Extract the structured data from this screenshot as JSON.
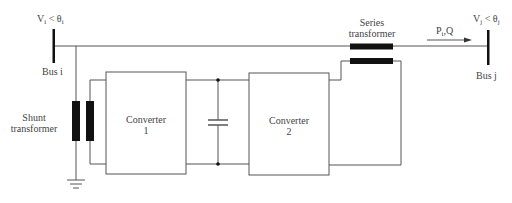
{
  "diagram": {
    "type": "UPFC schematic",
    "colors": {
      "wire": "#555555",
      "coil": "#111111",
      "bus": "#111111"
    },
    "bus_i": {
      "label": "Bus i",
      "voltage_main": "V",
      "voltage_sub": "i",
      "angle_sep": " < θ",
      "angle_sub": "i"
    },
    "bus_j": {
      "label": "Bus j",
      "voltage_main": "V",
      "voltage_sub": "j",
      "angle_sep": " < θ",
      "angle_sub": "j"
    },
    "power_flow": {
      "p": "P",
      "p_sub": "i",
      "q": "Q"
    },
    "series_transformer": {
      "line1": "Series",
      "line2": "transformer"
    },
    "shunt_transformer": {
      "line1": "Shunt",
      "line2": "transformer"
    },
    "converter_1": {
      "line1": "Converter",
      "line2": "1"
    },
    "converter_2": {
      "line1": "Converter",
      "line2": "2"
    }
  }
}
